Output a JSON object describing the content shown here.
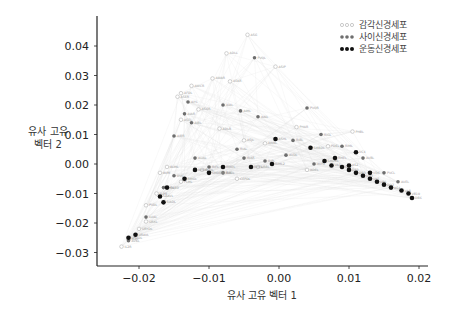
{
  "chart_data": {
    "type": "scatter",
    "title": "",
    "xlabel": "유사 고유 벡터 1",
    "ylabel_lines": [
      "유사 고유",
      "벡터 2"
    ],
    "xlim": [
      -0.026,
      0.021
    ],
    "ylim": [
      -0.034,
      0.05
    ],
    "xticks": [
      -0.02,
      -0.01,
      0.0,
      0.01,
      0.02
    ],
    "xtick_labels": [
      "−0.02",
      "−0.01",
      "0.00",
      "0.01",
      "0.02"
    ],
    "yticks": [
      -0.03,
      -0.02,
      -0.01,
      0.0,
      0.01,
      0.02,
      0.03,
      0.04
    ],
    "ytick_labels": [
      "−0.03",
      "−0.02",
      "−0.01",
      "0.00",
      "0.01",
      "0.02",
      "0.03",
      "0.04"
    ],
    "grid": false,
    "legend_position": "upper right",
    "edges_drawn": true,
    "edge_color": "#dcdcdc",
    "series": [
      {
        "name": "감각신경세포",
        "color": "#bdbdbd",
        "marker": "open-circle",
        "points": [
          [
            -0.0045,
            0.0438,
            "ASG"
          ],
          [
            -0.0075,
            0.0375,
            "ADLL"
          ],
          [
            -0.0005,
            0.033,
            "ASIP"
          ],
          [
            -0.0095,
            0.029,
            "AWAR"
          ],
          [
            -0.007,
            0.028,
            "ASKR"
          ],
          [
            -0.0125,
            0.0265,
            "AWCR"
          ],
          [
            -0.014,
            0.024,
            "AFDL"
          ],
          [
            -0.0145,
            0.0228,
            "ASER"
          ],
          [
            -0.0115,
            0.0185,
            "ASGR"
          ],
          [
            -0.014,
            0.015,
            "ASEL"
          ],
          [
            -0.0085,
            0.012,
            "ADLR"
          ],
          [
            0.0025,
            0.0125,
            "PHAR"
          ],
          [
            0.0105,
            0.011,
            "PHBL"
          ],
          [
            -0.005,
            0.008,
            "ASJL"
          ],
          [
            -0.002,
            0.007,
            "AWBL"
          ],
          [
            -0.016,
            -0.001,
            "ALML"
          ],
          [
            -0.017,
            -0.003,
            "AVM"
          ],
          [
            -0.014,
            -0.006,
            "PLML"
          ],
          [
            -0.0175,
            -0.01,
            "FLPR"
          ],
          [
            -0.019,
            -0.014,
            "PVDL"
          ],
          [
            -0.019,
            -0.0195,
            "URXL"
          ],
          [
            -0.02,
            -0.022,
            "URYDL"
          ],
          [
            -0.0215,
            -0.0255,
            "IL2L"
          ],
          [
            -0.0225,
            -0.028,
            "IL2R"
          ],
          [
            -0.011,
            -0.002,
            "OLQL"
          ],
          [
            -0.006,
            -0.005,
            "CEPDL"
          ],
          [
            0.004,
            -0.002,
            "ADEL"
          ],
          [
            0.007,
            0.006,
            "PDEL"
          ],
          [
            -0.008,
            -0.003,
            "BAGL"
          ],
          [
            -0.003,
            -0.001,
            "URBL"
          ]
        ]
      },
      {
        "name": "사이신경세포",
        "color": "#6e6e6e",
        "marker": "filled-circle",
        "points": [
          [
            -0.0035,
            0.036,
            "PVQL"
          ],
          [
            0.004,
            0.019,
            "PVQR"
          ],
          [
            -0.013,
            0.021,
            "AIYL"
          ],
          [
            -0.008,
            0.02,
            "AIAL"
          ],
          [
            -0.0135,
            0.017,
            "AIAR"
          ],
          [
            -0.0125,
            0.014,
            "AIBL"
          ],
          [
            -0.015,
            0.0095,
            "AIBR"
          ],
          [
            -0.0055,
            0.018,
            "AIML"
          ],
          [
            -0.003,
            0.016,
            "AINL"
          ],
          [
            -0.006,
            0.005,
            "RIAL"
          ],
          [
            -0.005,
            0.002,
            "RIAR"
          ],
          [
            0.002,
            0.008,
            "RIBL"
          ],
          [
            0.006,
            0.01,
            "RIGL"
          ],
          [
            0.009,
            0.006,
            "RIML"
          ],
          [
            0.012,
            0.002,
            "AVBL"
          ],
          [
            -0.012,
            0.002,
            "AUAL"
          ],
          [
            -0.01,
            -0.001,
            "RIFL"
          ],
          [
            -0.008,
            -0.003,
            "RIR"
          ],
          [
            -0.015,
            -0.004,
            "DVC"
          ],
          [
            -0.0165,
            -0.008,
            "PVPL"
          ],
          [
            -0.019,
            -0.018,
            "LUAL"
          ],
          [
            -0.0215,
            -0.026,
            "AVKL"
          ],
          [
            0.001,
            0.003,
            "AVDL"
          ],
          [
            0.015,
            -0.003,
            "PVCL"
          ],
          [
            0.017,
            -0.006,
            "AVEL"
          ],
          [
            0.005,
            0.0,
            "AVHL"
          ],
          [
            -0.002,
            0.001,
            "RIPL"
          ]
        ]
      },
      {
        "name": "운동신경세포",
        "color": "#111111",
        "marker": "filled-circle",
        "points": [
          [
            -0.0005,
            0.0085,
            "ASHL"
          ],
          [
            0.0045,
            0.0055,
            "SMBDL"
          ],
          [
            0.008,
            0.002,
            "RMEL"
          ],
          [
            0.011,
            0.004,
            "VC4"
          ],
          [
            0.0075,
            -0.0005,
            "VA1"
          ],
          [
            0.009,
            -0.001,
            "VB2"
          ],
          [
            0.01,
            -0.002,
            "DA2"
          ],
          [
            0.011,
            -0.003,
            "DB3"
          ],
          [
            0.012,
            -0.004,
            "VD3"
          ],
          [
            0.013,
            -0.005,
            "VA5"
          ],
          [
            0.014,
            -0.006,
            "VB6"
          ],
          [
            0.015,
            -0.007,
            "DD2"
          ],
          [
            0.016,
            -0.008,
            "AS4"
          ],
          [
            0.0175,
            -0.009,
            "VA8"
          ],
          [
            0.0185,
            -0.01,
            "VB10"
          ],
          [
            0.019,
            -0.0115,
            "DB6"
          ],
          [
            0.013,
            -0.003,
            "VD6"
          ],
          [
            0.01,
            -0.0005,
            "AS2"
          ],
          [
            0.0065,
            0.001,
            "SMDVL"
          ],
          [
            -0.008,
            -0.001,
            "RMDL"
          ],
          [
            -0.01,
            -0.003,
            "SMDDR"
          ],
          [
            -0.012,
            -0.002,
            "RMDR"
          ],
          [
            -0.0135,
            -0.005,
            "RMGL"
          ],
          [
            -0.016,
            -0.008,
            "SABD"
          ],
          [
            -0.017,
            -0.011,
            "SAAVL"
          ],
          [
            -0.0165,
            -0.013,
            "SIADL"
          ],
          [
            -0.0215,
            -0.025,
            "URADL"
          ],
          [
            -0.0205,
            -0.024,
            "URAVL"
          ],
          [
            -0.004,
            -0.001,
            "RMFL"
          ],
          [
            -0.001,
            0.0,
            "RIML2"
          ]
        ]
      }
    ]
  },
  "legend": {
    "items": [
      {
        "label": "감각신경세포",
        "color": "#bdbdbd",
        "open": true
      },
      {
        "label": "사이신경세포",
        "color": "#6e6e6e",
        "open": false
      },
      {
        "label": "운동신경세포",
        "color": "#111111",
        "open": false
      }
    ]
  }
}
